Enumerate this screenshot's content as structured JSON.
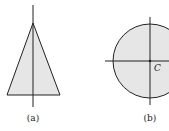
{
  "figures": [
    {
      "id": "a",
      "shape": "triangle",
      "caption": "(a)",
      "fill": "#e6e6e6",
      "stroke": "#222222"
    },
    {
      "id": "b",
      "shape": "circle",
      "caption": "(b)",
      "center_label": "C",
      "fill": "#e6e6e6",
      "stroke": "#222222"
    }
  ]
}
